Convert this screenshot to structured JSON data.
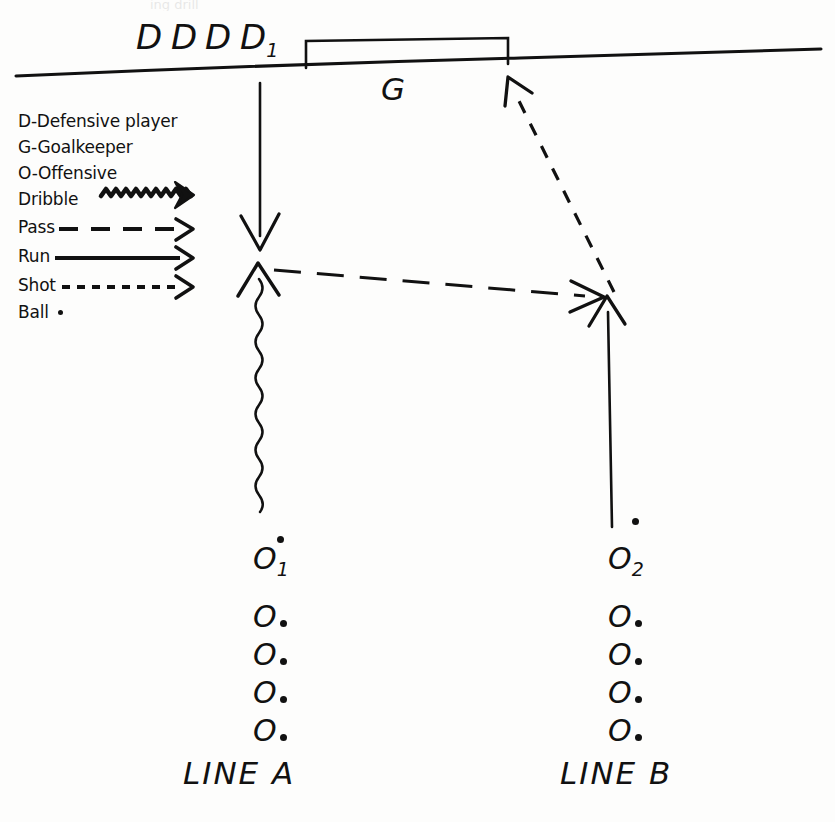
{
  "diagram": {
    "ink_color": "#111111",
    "background_color": "#fdfdfc",
    "top_cut_text": "ing drill"
  },
  "legend": {
    "items": [
      {
        "text": "D-Defensive player",
        "symbol": "none"
      },
      {
        "text": "G-Goalkeeper",
        "symbol": "none"
      },
      {
        "text": "O-Offensive",
        "symbol": "none"
      },
      {
        "text": "Dribble",
        "symbol": "wavy-arrow"
      },
      {
        "text": "Pass",
        "symbol": "dashed-arrow"
      },
      {
        "text": "Run",
        "symbol": "solid-arrow"
      },
      {
        "text": "Shot",
        "symbol": "dotted-arrow"
      },
      {
        "text": "Ball",
        "symbol": "dot"
      }
    ]
  },
  "field": {
    "goal_label": "G",
    "defenders": [
      {
        "label": "D"
      },
      {
        "label": "D"
      },
      {
        "label": "D"
      },
      {
        "label": "D",
        "sub": "1"
      }
    ]
  },
  "lines": {
    "a": {
      "name": "LINE A",
      "players": [
        {
          "label": "O",
          "sub": "1",
          "dot": "above"
        },
        {
          "label": "O",
          "dot": "right"
        },
        {
          "label": "O",
          "dot": "right"
        },
        {
          "label": "O",
          "dot": "right"
        },
        {
          "label": "O",
          "dot": "right"
        }
      ]
    },
    "b": {
      "name": "LINE B",
      "players": [
        {
          "label": "O",
          "sub": "2",
          "dot": "above"
        },
        {
          "label": "O",
          "dot": "right"
        },
        {
          "label": "O",
          "dot": "right"
        },
        {
          "label": "O",
          "dot": "right"
        },
        {
          "label": "O",
          "dot": "right"
        }
      ]
    }
  },
  "movements": [
    {
      "name": "defender-run-down",
      "type": "run",
      "from": "goal-line",
      "to": "midfield-left"
    },
    {
      "name": "o1-dribble-up",
      "type": "dribble",
      "from": "LINE A",
      "to": "midfield-left"
    },
    {
      "name": "pass-to-o2",
      "type": "pass",
      "from": "midfield-left",
      "to": "midfield-right"
    },
    {
      "name": "o2-run-up",
      "type": "run",
      "from": "LINE B",
      "to": "midfield-right"
    },
    {
      "name": "shot-on-goal",
      "type": "shot",
      "from": "midfield-right",
      "to": "goal-right-post"
    }
  ]
}
